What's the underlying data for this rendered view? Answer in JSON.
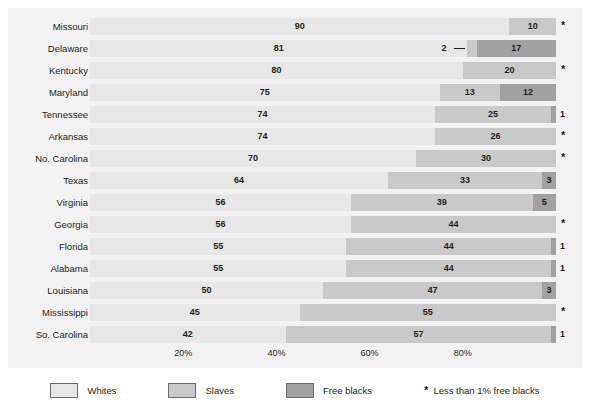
{
  "chart_data": {
    "type": "bar",
    "subtype": "horizontal-stacked-100",
    "title": "",
    "xlabel": "",
    "ylabel": "",
    "xlim": [
      0,
      100
    ],
    "grid": false,
    "legend_position": "bottom",
    "axis_ticks": [
      "20%",
      "40%",
      "60%",
      "80%"
    ],
    "axis_tick_values": [
      20,
      40,
      60,
      80
    ],
    "categories": [
      "Missouri",
      "Delaware",
      "Kentucky",
      "Maryland",
      "Tennessee",
      "Arkansas",
      "No. Carolina",
      "Texas",
      "Virginia",
      "Georgia",
      "Florida",
      "Alabama",
      "Louisiana",
      "Mississippi",
      "So. Carolina"
    ],
    "series": [
      {
        "name": "Whites",
        "color": "#e7e7e7",
        "values": [
          90,
          81,
          80,
          75,
          74,
          74,
          70,
          64,
          56,
          56,
          55,
          55,
          50,
          45,
          42
        ]
      },
      {
        "name": "Slaves",
        "color": "#c9c9c9",
        "values": [
          10,
          2,
          20,
          13,
          25,
          26,
          30,
          33,
          39,
          44,
          44,
          44,
          47,
          55,
          57
        ]
      },
      {
        "name": "Free blacks",
        "color": "#a1a1a1",
        "values": [
          0.5,
          17,
          0.5,
          12,
          1,
          0.5,
          0.5,
          3,
          5,
          0.5,
          1,
          1,
          3,
          0.5,
          1
        ]
      }
    ],
    "annotations": [
      "* Less than 1% free blacks"
    ]
  },
  "rows": [
    {
      "label": "Missouri",
      "whites": {
        "value": 90,
        "text": "90"
      },
      "slaves": {
        "value": 10,
        "text": "10"
      },
      "free": {
        "value": 0,
        "text": "",
        "marker": "*"
      }
    },
    {
      "label": "Delaware",
      "whites": {
        "value": 81,
        "text": "81"
      },
      "slaves": {
        "value": 2,
        "text": "2",
        "callout": true
      },
      "free": {
        "value": 17,
        "text": "17"
      }
    },
    {
      "label": "Kentucky",
      "whites": {
        "value": 80,
        "text": "80"
      },
      "slaves": {
        "value": 20,
        "text": "20"
      },
      "free": {
        "value": 0,
        "text": "",
        "marker": "*"
      }
    },
    {
      "label": "Maryland",
      "whites": {
        "value": 75,
        "text": "75"
      },
      "slaves": {
        "value": 13,
        "text": "13"
      },
      "free": {
        "value": 12,
        "text": "12"
      }
    },
    {
      "label": "Tennessee",
      "whites": {
        "value": 74,
        "text": "74"
      },
      "slaves": {
        "value": 25,
        "text": "25"
      },
      "free": {
        "value": 1,
        "text": "",
        "marker": "1"
      }
    },
    {
      "label": "Arkansas",
      "whites": {
        "value": 74,
        "text": "74"
      },
      "slaves": {
        "value": 26,
        "text": "26"
      },
      "free": {
        "value": 0,
        "text": "",
        "marker": "*"
      }
    },
    {
      "label": "No. Carolina",
      "whites": {
        "value": 70,
        "text": "70"
      },
      "slaves": {
        "value": 30,
        "text": "30"
      },
      "free": {
        "value": 0,
        "text": "",
        "marker": "*"
      }
    },
    {
      "label": "Texas",
      "whites": {
        "value": 64,
        "text": "64"
      },
      "slaves": {
        "value": 33,
        "text": "33"
      },
      "free": {
        "value": 3,
        "text": "3"
      }
    },
    {
      "label": "Virginia",
      "whites": {
        "value": 56,
        "text": "56"
      },
      "slaves": {
        "value": 39,
        "text": "39"
      },
      "free": {
        "value": 5,
        "text": "5"
      }
    },
    {
      "label": "Georgia",
      "whites": {
        "value": 56,
        "text": "56"
      },
      "slaves": {
        "value": 44,
        "text": "44"
      },
      "free": {
        "value": 0,
        "text": "",
        "marker": "*"
      }
    },
    {
      "label": "Florida",
      "whites": {
        "value": 55,
        "text": "55"
      },
      "slaves": {
        "value": 44,
        "text": "44"
      },
      "free": {
        "value": 1,
        "text": "",
        "marker": "1"
      }
    },
    {
      "label": "Alabama",
      "whites": {
        "value": 55,
        "text": "55"
      },
      "slaves": {
        "value": 44,
        "text": "44"
      },
      "free": {
        "value": 1,
        "text": "",
        "marker": "1"
      }
    },
    {
      "label": "Louisiana",
      "whites": {
        "value": 50,
        "text": "50"
      },
      "slaves": {
        "value": 47,
        "text": "47"
      },
      "free": {
        "value": 3,
        "text": "3"
      }
    },
    {
      "label": "Mississippi",
      "whites": {
        "value": 45,
        "text": "45"
      },
      "slaves": {
        "value": 55,
        "text": "55"
      },
      "free": {
        "value": 0,
        "text": "",
        "marker": "*"
      }
    },
    {
      "label": "So. Carolina",
      "whites": {
        "value": 42,
        "text": "42"
      },
      "slaves": {
        "value": 57,
        "text": "57"
      },
      "free": {
        "value": 1,
        "text": "",
        "marker": "1"
      }
    }
  ],
  "axis": {
    "ticks": [
      {
        "label": "20%",
        "value": 20
      },
      {
        "label": "40%",
        "value": 40
      },
      {
        "label": "60%",
        "value": 60
      },
      {
        "label": "80%",
        "value": 80
      }
    ]
  },
  "legend": {
    "items": [
      {
        "label": "Whites",
        "color": "#e7e7e7",
        "swatch_class": "sw-whites"
      },
      {
        "label": "Slaves",
        "color": "#c9c9c9",
        "swatch_class": "sw-slaves"
      },
      {
        "label": "Free blacks",
        "color": "#a1a1a1",
        "swatch_class": "sw-free"
      }
    ],
    "note_marker": "*",
    "note_text": "Less than 1% free blacks"
  },
  "colors": {
    "whites": "#e7e7e7",
    "slaves": "#c9c9c9",
    "free_blacks": "#a1a1a1",
    "panel_background": "#f2f2f2",
    "text": "#231f20"
  }
}
